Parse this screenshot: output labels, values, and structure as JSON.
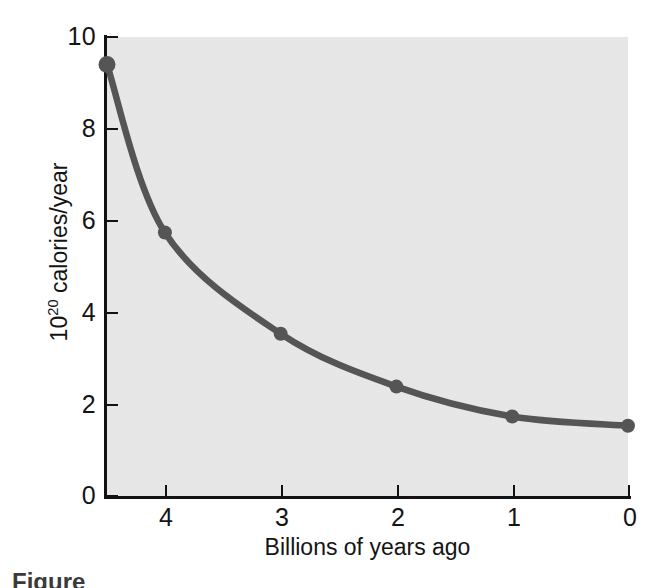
{
  "figure": {
    "background_color": "#ffffff",
    "plot_background_color": "#e9e9e9",
    "axis_color": "#121212",
    "series_color": "#555555",
    "caption_fragment": "Figure"
  },
  "chart_data": {
    "type": "line",
    "title": "",
    "subtitle": "",
    "xlabel": "Billions of years ago",
    "ylabel": "10^20 calories/year",
    "ylabel_base": "10",
    "ylabel_exponent": "20",
    "ylabel_rest": " calories/year",
    "x": [
      4.5,
      4,
      3,
      2,
      1,
      0
    ],
    "y": [
      9.4,
      5.75,
      3.55,
      2.4,
      1.75,
      1.55
    ],
    "points": [
      {
        "x": 4.5,
        "y": 9.4
      },
      {
        "x": 4,
        "y": 5.75
      },
      {
        "x": 3,
        "y": 3.55
      },
      {
        "x": 2,
        "y": 2.4
      },
      {
        "x": 1,
        "y": 1.75
      },
      {
        "x": 0,
        "y": 1.55
      }
    ],
    "series": [
      {
        "name": "Solar energy received",
        "values": [
          9.4,
          5.75,
          3.55,
          2.4,
          1.75,
          1.55
        ]
      }
    ],
    "xlim": [
      4.5,
      0
    ],
    "ylim": [
      0,
      10
    ],
    "x_reversed": true,
    "xticks": [
      4,
      3,
      2,
      1,
      0
    ],
    "xtick_labels": [
      "4",
      "3",
      "2",
      "1",
      "0"
    ],
    "yticks": [
      0,
      2,
      4,
      6,
      8,
      10
    ],
    "ytick_labels": [
      "0",
      "2",
      "4",
      "6",
      "8",
      "10"
    ],
    "grid": false,
    "legend": false,
    "legend_position": "none",
    "markers": true,
    "marker_shape": "circle",
    "line_width": 6,
    "annotations": []
  }
}
